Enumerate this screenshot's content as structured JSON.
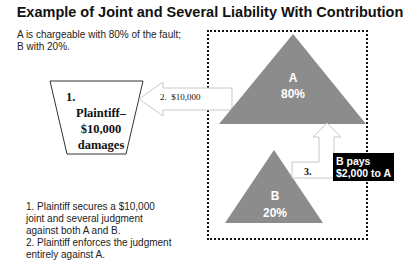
{
  "title": "Example of Joint and Several Liability With Contribution",
  "intro": [
    "A is chargeable with 80% of the fault;",
    "B with 20%."
  ],
  "plaintiff_box": {
    "number": "1.",
    "line1": "Plaintiff–",
    "line2": "$10,000",
    "line3": "damages"
  },
  "arrow2_label": "2.  $10,000",
  "triangle_a": {
    "name": "A",
    "percent": "80%"
  },
  "triangle_b": {
    "name": "B",
    "percent": "20%"
  },
  "arrow3_label": "3.",
  "callout": [
    "B pays",
    "$2,000 to A"
  ],
  "steps": [
    "1. Plaintiff secures a $10,000",
    "joint and several judgment",
    "against both A and B.",
    "2. Plaintiff enforces the judgment",
    "entirely against A."
  ],
  "colors": {
    "triangle_fill": "#8c8c8c",
    "callout_bg": "#000000",
    "arrow_outline": "#c8c8c8"
  }
}
